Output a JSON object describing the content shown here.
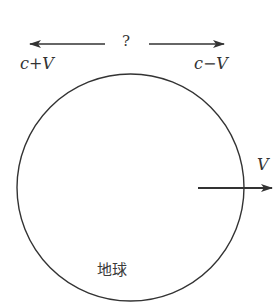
{
  "diagram": {
    "question_mark": "?",
    "left_speed_label": "c+V",
    "right_speed_label": "c−V",
    "velocity_label": "V",
    "earth_label": "地球",
    "colors": {
      "stroke": "#333333",
      "background": "#ffffff"
    },
    "earth_circle": {
      "cx": 130.5,
      "cy": 187.5,
      "r": 113.5
    }
  }
}
